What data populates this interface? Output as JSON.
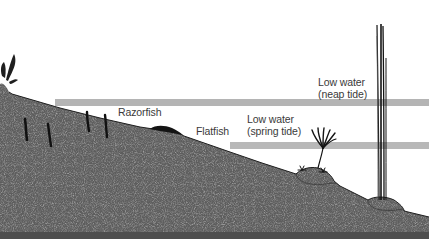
{
  "diagram": {
    "type": "shore-cross-section",
    "colors": {
      "background": "#ffffff",
      "ground": "#5f5f5f",
      "ground_speckle_light": "#8a8a8a",
      "ground_speckle_dark": "#4a4a4a",
      "tide_band": "#b4b4b4",
      "organism": "#1a1a1a",
      "text": "#3a3a3a"
    },
    "tide_levels": [
      {
        "id": "neap",
        "label_line1": "Low water",
        "label_line2": "(neap tide)"
      },
      {
        "id": "spring",
        "label_line1": "Low water",
        "label_line2": "(spring tide)"
      }
    ],
    "organisms": [
      {
        "id": "razorfish",
        "label": "Razorfish"
      },
      {
        "id": "flatfish",
        "label": "Flatfish"
      }
    ]
  }
}
